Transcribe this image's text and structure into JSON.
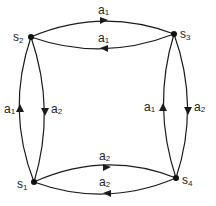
{
  "diagram": {
    "type": "state-transition-graph",
    "nodes": [
      {
        "id": "s1",
        "label": "s",
        "sub": "1",
        "x": 34,
        "y": 182
      },
      {
        "id": "s2",
        "label": "s",
        "sub": "2",
        "x": 31,
        "y": 37
      },
      {
        "id": "s3",
        "label": "s",
        "sub": "3",
        "x": 174,
        "y": 34
      },
      {
        "id": "s4",
        "label": "s",
        "sub": "4",
        "x": 176,
        "y": 178
      }
    ],
    "edges": [
      {
        "from": "s2",
        "to": "s3",
        "label": "a",
        "sub": "1"
      },
      {
        "from": "s3",
        "to": "s2",
        "label": "a",
        "sub": "1"
      },
      {
        "from": "s1",
        "to": "s2",
        "label": "a",
        "sub": "1"
      },
      {
        "from": "s2",
        "to": "s1",
        "label": "a",
        "sub": "2"
      },
      {
        "from": "s4",
        "to": "s3",
        "label": "a",
        "sub": "1"
      },
      {
        "from": "s3",
        "to": "s4",
        "label": "a",
        "sub": "2"
      },
      {
        "from": "s1",
        "to": "s4",
        "label": "a",
        "sub": "2"
      },
      {
        "from": "s4",
        "to": "s1",
        "label": "a",
        "sub": "2"
      }
    ]
  }
}
